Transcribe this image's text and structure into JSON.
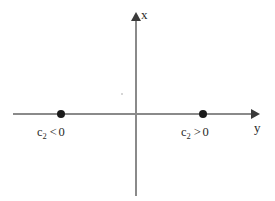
{
  "figure": {
    "type": "phase-line-diagram",
    "background_color": "#ffffff",
    "axis_color": "#8a8a8a",
    "arrow_color": "#3a3a3a",
    "point_color": "#1a1a1a",
    "text_color": "#2a2a2a"
  },
  "axes": {
    "vertical": {
      "label": "x",
      "direction": "up",
      "origin_px": [
        136,
        114
      ],
      "tip_px": [
        136,
        15
      ]
    },
    "horizontal": {
      "label": "y",
      "direction": "right",
      "origin_px": [
        136,
        114
      ],
      "tip_px": [
        258,
        114
      ]
    }
  },
  "points": [
    {
      "name": "equilibrium-left",
      "position_px": [
        61,
        114
      ],
      "on_axis": "y",
      "side": "negative"
    },
    {
      "name": "equilibrium-right",
      "position_px": [
        203,
        114
      ],
      "on_axis": "y",
      "side": "positive"
    }
  ],
  "annotations": {
    "left": {
      "variable": "c",
      "subscript": "2",
      "relation": "<",
      "value": "0",
      "full_text": "c2 < 0"
    },
    "right": {
      "variable": "c",
      "subscript": "2",
      "relation": ">",
      "value": "0",
      "full_text": "c2 > 0"
    }
  }
}
